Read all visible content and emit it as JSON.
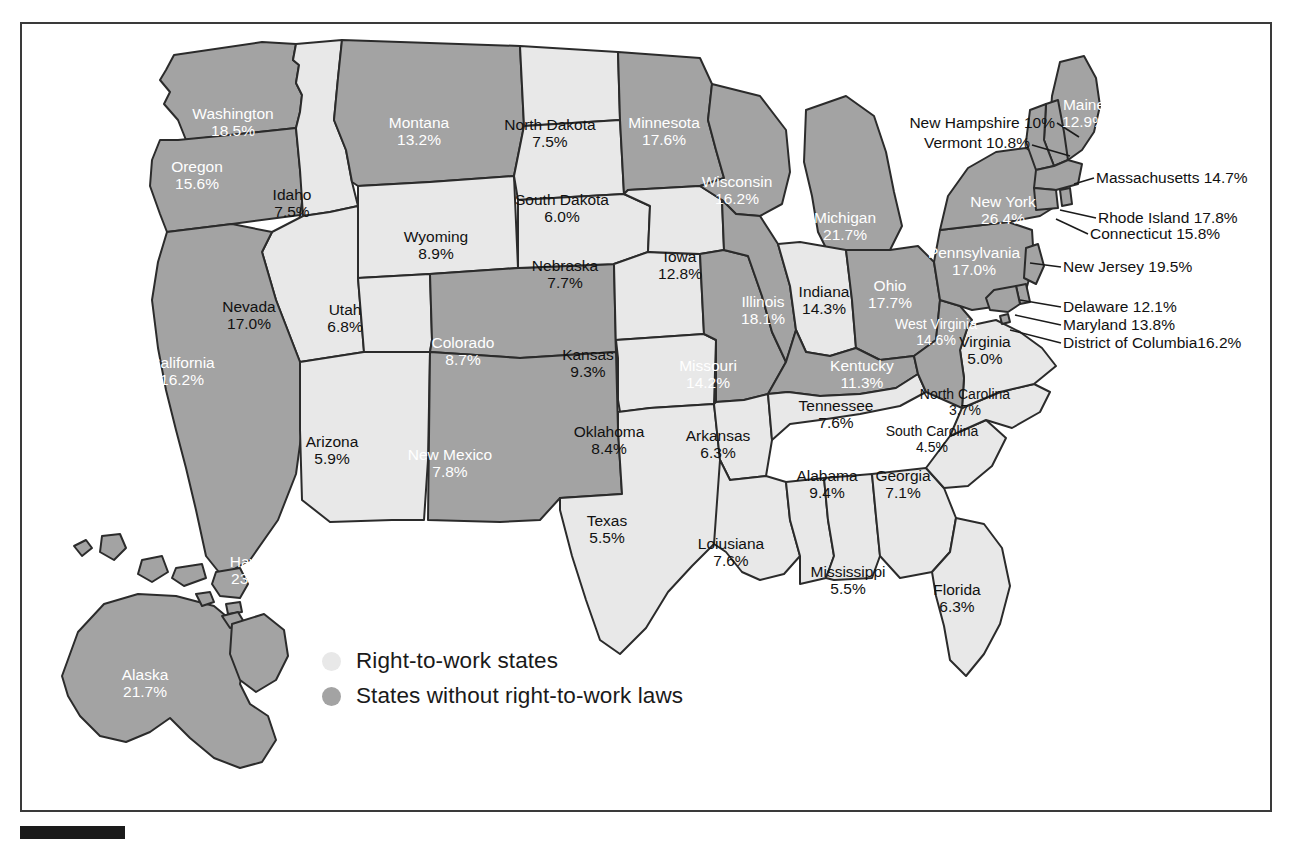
{
  "map": {
    "title": "Union membership rate by state with right-to-work status",
    "colors": {
      "right_to_work_fill": "#e8e8e8",
      "no_right_to_work_fill": "#a3a3a3",
      "border": "#2b2b2b",
      "frame": "#3a3a3a",
      "dark_label_text": "#ffffff",
      "light_label_text": "#111111"
    }
  },
  "legend": {
    "items": [
      {
        "label": "Right-to-work states",
        "swatch": "#e8e8e8",
        "right_to_work": true
      },
      {
        "label": "States without right-to-work laws",
        "swatch": "#a3a3a3",
        "right_to_work": false
      }
    ]
  },
  "chart_data": {
    "type": "map",
    "value_unit": "percent",
    "categories": [
      "Right-to-work states",
      "States without right-to-work laws"
    ],
    "states": [
      {
        "name": "Washington",
        "value": "18.5%",
        "right_to_work": false,
        "x": 233,
        "y": 122,
        "style": "inline"
      },
      {
        "name": "Oregon",
        "value": "15.6%",
        "x": 197,
        "y": 175,
        "right_to_work": false,
        "style": "inline"
      },
      {
        "name": "Idaho",
        "value": "7.5%",
        "x": 292,
        "y": 203,
        "right_to_work": true,
        "style": "inline"
      },
      {
        "name": "Montana",
        "value": "13.2%",
        "x": 419,
        "y": 131,
        "right_to_work": false,
        "style": "inline"
      },
      {
        "name": "Wyoming",
        "value": "8.9%",
        "x": 436,
        "y": 245,
        "right_to_work": true,
        "style": "inline"
      },
      {
        "name": "Nevada",
        "value": "17.0%",
        "x": 249,
        "y": 315,
        "right_to_work": true,
        "style": "inline"
      },
      {
        "name": "Utah",
        "value": "6.8%",
        "x": 345,
        "y": 318,
        "right_to_work": true,
        "style": "inline"
      },
      {
        "name": "California",
        "value": "16.2%",
        "x": 182,
        "y": 371,
        "right_to_work": false,
        "style": "inline"
      },
      {
        "name": "Arizona",
        "value": "5.9%",
        "x": 332,
        "y": 450,
        "right_to_work": true,
        "style": "inline"
      },
      {
        "name": "Colorado",
        "value": "8.7%",
        "x": 463,
        "y": 351,
        "right_to_work": false,
        "style": "inline"
      },
      {
        "name": "New Mexico",
        "value": "7.8%",
        "x": 450,
        "y": 463,
        "right_to_work": false,
        "style": "inline"
      },
      {
        "name": "North Dakota",
        "value": "7.5%",
        "x": 550,
        "y": 133,
        "right_to_work": true,
        "style": "inline"
      },
      {
        "name": "South Dakota",
        "value": "6.0%",
        "x": 562,
        "y": 208,
        "right_to_work": true,
        "style": "inline"
      },
      {
        "name": "Nebraska",
        "value": "7.7%",
        "x": 565,
        "y": 274,
        "right_to_work": true,
        "style": "inline"
      },
      {
        "name": "Kansas",
        "value": "9.3%",
        "x": 588,
        "y": 363,
        "right_to_work": true,
        "style": "inline"
      },
      {
        "name": "Oklahoma",
        "value": "8.4%",
        "x": 609,
        "y": 440,
        "right_to_work": true,
        "style": "inline"
      },
      {
        "name": "Texas",
        "value": "5.5%",
        "x": 607,
        "y": 529,
        "right_to_work": true,
        "style": "inline"
      },
      {
        "name": "Minnesota",
        "value": "17.6%",
        "x": 664,
        "y": 131,
        "right_to_work": false,
        "style": "inline"
      },
      {
        "name": "Iowa",
        "value": "12.8%",
        "x": 680,
        "y": 265,
        "right_to_work": true,
        "style": "inline"
      },
      {
        "name": "Missouri",
        "value": "14.2%",
        "x": 708,
        "y": 374,
        "right_to_work": false,
        "style": "inline"
      },
      {
        "name": "Arkansas",
        "value": "6.3%",
        "x": 718,
        "y": 444,
        "right_to_work": true,
        "style": "inline"
      },
      {
        "name": "Loiusiana",
        "value": "7.6%",
        "x": 731,
        "y": 552,
        "right_to_work": true,
        "style": "inline"
      },
      {
        "name": "Wisconsin",
        "value": "16.2%",
        "x": 737,
        "y": 190,
        "right_to_work": false,
        "style": "inline"
      },
      {
        "name": "Illinois",
        "value": "18.1%",
        "x": 763,
        "y": 310,
        "right_to_work": false,
        "style": "inline"
      },
      {
        "name": "Michigan",
        "value": "21.7%",
        "x": 845,
        "y": 226,
        "right_to_work": false,
        "style": "inline"
      },
      {
        "name": "Indiana",
        "value": "14.3%",
        "x": 824,
        "y": 300,
        "right_to_work": true,
        "style": "inline"
      },
      {
        "name": "Ohio",
        "value": "17.7%",
        "x": 890,
        "y": 294,
        "right_to_work": false,
        "style": "inline"
      },
      {
        "name": "Kentucky",
        "value": "11.3%",
        "x": 862,
        "y": 374,
        "right_to_work": false,
        "style": "inline"
      },
      {
        "name": "Tennessee",
        "value": "7.6%",
        "x": 836,
        "y": 414,
        "right_to_work": true,
        "style": "inline"
      },
      {
        "name": "Mississippi",
        "value": "5.5%",
        "x": 848,
        "y": 580,
        "right_to_work": true,
        "style": "inline"
      },
      {
        "name": "Alabama",
        "value": "9.4%",
        "x": 827,
        "y": 484,
        "right_to_work": true,
        "style": "inline"
      },
      {
        "name": "Georgia",
        "value": "7.1%",
        "x": 903,
        "y": 484,
        "right_to_work": true,
        "style": "inline"
      },
      {
        "name": "Florida",
        "value": "6.3%",
        "x": 957,
        "y": 598,
        "right_to_work": true,
        "style": "inline"
      },
      {
        "name": "South Carolina",
        "value": "4.5%",
        "x": 932,
        "y": 440,
        "right_to_work": true,
        "style": "inline"
      },
      {
        "name": "North Carolina",
        "value": "3.7%",
        "x": 965,
        "y": 403,
        "right_to_work": true,
        "style": "inline"
      },
      {
        "name": "Virginia",
        "value": "5.0%",
        "x": 985,
        "y": 350,
        "right_to_work": true,
        "style": "inline"
      },
      {
        "name": "West Virginia",
        "value": "14.6%",
        "x": 936,
        "y": 333,
        "right_to_work": false,
        "style": "inline"
      },
      {
        "name": "Pennsylvania",
        "value": "17.0%",
        "x": 974,
        "y": 261,
        "right_to_work": false,
        "style": "inline"
      },
      {
        "name": "New York",
        "value": "26.4%",
        "x": 1003,
        "y": 210,
        "right_to_work": false,
        "style": "inline"
      },
      {
        "name": "Maine",
        "value": "12.9%",
        "x": 1084,
        "y": 113,
        "right_to_work": false,
        "style": "inline"
      },
      {
        "name": "Alaska",
        "value": "21.7%",
        "x": 145,
        "y": 683,
        "right_to_work": false,
        "style": "inline"
      },
      {
        "name": "Hawaii",
        "value": "23.7%",
        "x": 253,
        "y": 570,
        "right_to_work": false,
        "style": "hawaii"
      }
    ],
    "callouts": [
      {
        "name": "New Hampshire",
        "value": "10%",
        "text": "New Hampshire 10%",
        "right_to_work": false,
        "tx": 1055,
        "ty": 123,
        "side": "left",
        "line": [
          [
            1057,
            123
          ],
          [
            1079,
            137
          ]
        ]
      },
      {
        "name": "Vermont",
        "value": "10.8%",
        "text": "Vermont 10.8%",
        "right_to_work": false,
        "tx": 1030,
        "ty": 143,
        "side": "left",
        "line": [
          [
            1032,
            145
          ],
          [
            1070,
            156
          ]
        ]
      },
      {
        "name": "Massachusetts",
        "value": "14.7%",
        "text": "Massachusetts 14.7%",
        "right_to_work": false,
        "tx": 1096,
        "ty": 178,
        "side": "right",
        "line": [
          [
            1094,
            178
          ],
          [
            1074,
            184
          ]
        ]
      },
      {
        "name": "Rhode Island",
        "value": "17.8%",
        "text": "Rhode Island 17.8%",
        "right_to_work": false,
        "tx": 1098,
        "ty": 218,
        "side": "right",
        "line": [
          [
            1096,
            218
          ],
          [
            1060,
            210
          ]
        ]
      },
      {
        "name": "Connecticut",
        "value": "15.8%",
        "text": "Connecticut 15.8%",
        "right_to_work": false,
        "tx": 1090,
        "ty": 234,
        "side": "right",
        "line": [
          [
            1088,
            234
          ],
          [
            1056,
            219
          ]
        ]
      },
      {
        "name": "New Jersey",
        "value": "19.5%",
        "text": "New Jersey 19.5%",
        "right_to_work": false,
        "tx": 1063,
        "ty": 267,
        "side": "right",
        "line": [
          [
            1061,
            267
          ],
          [
            1030,
            263
          ]
        ]
      },
      {
        "name": "Delaware",
        "value": "12.1%",
        "text": "Delaware 12.1%",
        "right_to_work": false,
        "tx": 1063,
        "ty": 307,
        "side": "right",
        "line": [
          [
            1061,
            307
          ],
          [
            1020,
            300
          ]
        ]
      },
      {
        "name": "Maryland",
        "value": "13.8%",
        "text": "Maryland 13.8%",
        "right_to_work": false,
        "tx": 1063,
        "ty": 325,
        "side": "right",
        "line": [
          [
            1061,
            325
          ],
          [
            1015,
            315
          ]
        ]
      },
      {
        "name": "District of Columbia",
        "value": "16.2%",
        "text": "District of Columbia16.2%",
        "right_to_work": false,
        "tx": 1063,
        "ty": 343,
        "side": "right",
        "line": [
          [
            1061,
            343
          ],
          [
            1010,
            330
          ]
        ]
      }
    ]
  }
}
